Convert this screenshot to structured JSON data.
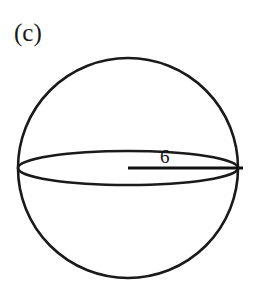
{
  "figure": {
    "part_label": "(c)",
    "caption": "",
    "background_color": "#ffffff",
    "stroke_color": "#1a1a1a"
  },
  "diagram": {
    "shape_name": "sphere",
    "circle": {
      "center_x": 128,
      "center_y": 168,
      "radius": 110,
      "stroke_width": 2.6
    },
    "equator_ellipse": {
      "center_x": 128,
      "center_y": 168,
      "radius_x": 110,
      "radius_y": 17,
      "stroke_width": 2.6
    },
    "radius_segment": {
      "from_x": 128,
      "from_y": 168,
      "to_x": 243,
      "to_y": 168,
      "stroke_width": 2.8
    },
    "dimension": {
      "value": "6",
      "units": "",
      "measures": "radius"
    }
  }
}
